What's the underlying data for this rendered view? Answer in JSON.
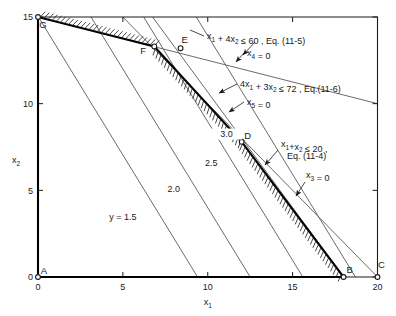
{
  "figure": {
    "type": "linear-programming-feasible-region-plot",
    "background": "#ffffff",
    "ink": "#1a1a1a",
    "constraint_line_color": "#5a5a5a",
    "boundary_color": "#000000"
  },
  "axes": {
    "x": {
      "label": "x",
      "label_sub": "1",
      "min": 0,
      "max": 20,
      "ticks": [
        0,
        5,
        10,
        15,
        20
      ],
      "tick_labels": [
        "0",
        "5",
        "10",
        "15",
        "20"
      ]
    },
    "y": {
      "label": "x",
      "label_sub": "2",
      "min": 0,
      "max": 15,
      "ticks": [
        0,
        5,
        10,
        15
      ],
      "tick_labels": [
        "0",
        "5",
        "10",
        "15"
      ]
    }
  },
  "vertices": [
    {
      "id": "A",
      "label": "A",
      "x": 0,
      "y": 0,
      "label_dx": 6,
      "label_dy": -3
    },
    {
      "id": "B",
      "label": "B",
      "x": 18,
      "y": 0,
      "label_dx": 6,
      "label_dy": -4
    },
    {
      "id": "C",
      "label": "C",
      "x": 20,
      "y": 0,
      "label_dx": 4,
      "label_dy": -9
    },
    {
      "id": "D",
      "label": "D",
      "x": 12,
      "y": 7.8,
      "label_dx": 6,
      "label_dy": -3
    },
    {
      "id": "E",
      "label": "E",
      "x": 8.4,
      "y": 13.2,
      "label_dx": 4,
      "label_dy": -5
    },
    {
      "id": "F",
      "label": "F",
      "x": 6.85,
      "y": 13.3,
      "label_dx": -11,
      "label_dy": 8
    },
    {
      "id": "G",
      "label": "G",
      "x": 0,
      "y": 15,
      "label_dx": 5,
      "label_dy": 11
    }
  ],
  "feasible_region_path": [
    {
      "x": 0,
      "y": 0
    },
    {
      "x": 18,
      "y": 0
    },
    {
      "x": 12,
      "y": 7.8
    },
    {
      "x": 6.85,
      "y": 13.3
    },
    {
      "x": 0,
      "y": 15
    }
  ],
  "constraints": [
    {
      "id": "c4",
      "equation": "x",
      "equation_parts": [
        "x",
        "1",
        " + x",
        "2",
        " ≤ 20 ,"
      ],
      "text_line1": "x₁+x₂ ≤ 20 ,",
      "text_line2": "Eq. (11-4)",
      "eq_ref": "Eq. (11-4)",
      "line_from": {
        "x": 20,
        "y": 0
      },
      "line_to": {
        "x": 5,
        "y": 15
      },
      "slack_var": "x₃ = 0",
      "slack_label": "x",
      "slack_sub": "3",
      "slack_eq": " = 0"
    },
    {
      "id": "c5",
      "text_line1": "x₁ + 4x₂ ≤ 60 , Eq. (11-5)",
      "eq_ref": "Eq. (11-5)",
      "line_from": {
        "x": 0,
        "y": 15
      },
      "line_to": {
        "x": 20,
        "y": 10
      },
      "slack_var": "x₄ = 0",
      "slack_label": "x",
      "slack_sub": "4",
      "slack_eq": " = 0"
    },
    {
      "id": "c6",
      "text_line1": "4x₁ + 3x₂ ≤ 72 , Eq.(11-6)",
      "eq_ref": "Eq.(11-6)",
      "line_from": {
        "x": 2.25,
        "y": 21
      },
      "line_to": {
        "x": 18,
        "y": 0
      },
      "slack_var": "x₅ = 0",
      "slack_label": "x",
      "slack_sub": "5",
      "slack_eq": " = 0"
    }
  ],
  "objective_lines": [
    {
      "id": "iso-1.5",
      "label": "y = 1.5",
      "value": 1.5,
      "x_intercept": 9.4,
      "label_x": 5.0,
      "label_y": 3.3
    },
    {
      "id": "iso-2.0",
      "label": "2.0",
      "value": 2.0,
      "x_intercept": 12.5,
      "label_x": 8.0,
      "label_y": 4.9
    },
    {
      "id": "iso-2.5",
      "label": "2.5",
      "value": 2.5,
      "x_intercept": 15.6,
      "label_x": 10.2,
      "label_y": 6.4
    },
    {
      "id": "iso-3.0",
      "label": "3.0",
      "value": 3.0,
      "x_intercept": 18.7,
      "label_x": 11.1,
      "label_y": 8.1
    }
  ],
  "iso_slope": -1.6,
  "iso_top_y": 15,
  "chart_data": {
    "type": "line",
    "title": "",
    "xlabel": "x1",
    "ylabel": "x2",
    "xlim": [
      0,
      20
    ],
    "ylim": [
      0,
      15
    ],
    "grid": false,
    "legend": "none",
    "series": [
      {
        "name": "x1 + x2 <= 20 (x3 = 0)",
        "x": [
          20,
          5
        ],
        "y": [
          0,
          15
        ]
      },
      {
        "name": "x1 + 4x2 <= 60 (x4 = 0)",
        "x": [
          0,
          20
        ],
        "y": [
          15,
          10
        ]
      },
      {
        "name": "4x1 + 3x2 <= 72 (x5 = 0)",
        "x": [
          2.25,
          18
        ],
        "y": [
          21,
          0
        ]
      },
      {
        "name": "feasible region boundary A-B-D-F-G",
        "x": [
          0,
          18,
          12,
          6.85,
          0
        ],
        "y": [
          0,
          0,
          7.8,
          13.3,
          15
        ]
      },
      {
        "name": "objective y = 1.5",
        "x": [
          0,
          9.4
        ],
        "y": [
          15.04,
          0
        ]
      },
      {
        "name": "objective 2.0",
        "x": [
          0,
          12.5
        ],
        "y": [
          20,
          0
        ]
      },
      {
        "name": "objective 2.5",
        "x": [
          0,
          15.6
        ],
        "y": [
          24.96,
          0
        ]
      },
      {
        "name": "objective 3.0",
        "x": [
          0,
          18.7
        ],
        "y": [
          29.92,
          0
        ]
      }
    ],
    "annotations": [
      {
        "text": "A",
        "x": 0,
        "y": 0
      },
      {
        "text": "B",
        "x": 18,
        "y": 0
      },
      {
        "text": "C",
        "x": 20,
        "y": 0
      },
      {
        "text": "D",
        "x": 12,
        "y": 7.8
      },
      {
        "text": "E",
        "x": 8.4,
        "y": 13.2
      },
      {
        "text": "F",
        "x": 6.85,
        "y": 13.3
      },
      {
        "text": "G",
        "x": 0,
        "y": 15
      },
      {
        "text": "x1 + 4x2 <= 60 , Eq. (11-5)",
        "x": 9.5,
        "y": 14.2
      },
      {
        "text": "x4 = 0",
        "x": 13.2,
        "y": 13.2
      },
      {
        "text": "4x1 + 3x2 <= 72 , Eq.(11-6)",
        "x": 11.6,
        "y": 11.1
      },
      {
        "text": "x5 = 0",
        "x": 12.2,
        "y": 9.9
      },
      {
        "text": "x1+x2 <= 20 , Eq. (11-4)",
        "x": 15.0,
        "y": 6.6
      },
      {
        "text": "x3 = 0",
        "x": 17.0,
        "y": 5.1
      },
      {
        "text": "y = 1.5",
        "x": 5.0,
        "y": 3.3
      },
      {
        "text": "2.0",
        "x": 8.0,
        "y": 4.9
      },
      {
        "text": "2.5",
        "x": 10.2,
        "y": 6.4
      },
      {
        "text": "3.0",
        "x": 11.1,
        "y": 8.1
      }
    ]
  }
}
